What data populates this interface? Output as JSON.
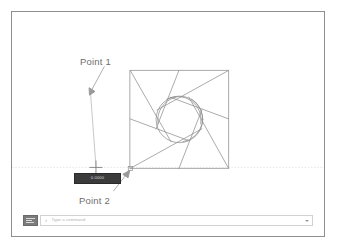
{
  "app": {
    "type": "cad-drawing-canvas",
    "background_color": "#ffffff",
    "frame_border_color": "#8e8e8e"
  },
  "canvas": {
    "tracking_line": {
      "label": "horizontal-tracking-line",
      "color": "#dcdcdc",
      "y": 157,
      "x_start": 0,
      "x_end": 314
    },
    "crosshair": {
      "label": "crosshair-cursor",
      "x": 84,
      "y": 157,
      "color": "#6f6f6f",
      "size": 9
    },
    "snap_marker": {
      "label": "endpoint-snap-marker",
      "x": 119,
      "y": 158,
      "color": "#8a8a8a",
      "size": 4
    }
  },
  "geometry": {
    "name": "pinwheel-square",
    "stroke_color": "#8d8d8d",
    "square": {
      "x": 119,
      "y": 59,
      "size": 99
    },
    "circle": {
      "cx": 168.5,
      "cy": 108.5,
      "r": 23.5
    },
    "blade_count": 7
  },
  "annotations": [
    {
      "id": "point-1",
      "label": "Point 1",
      "label_x": 68,
      "label_y": 44,
      "arrow_from": [
        92,
        56
      ],
      "arrow_to": [
        78,
        82
      ],
      "leader_to": [
        85,
        155
      ],
      "color": "#6e6e6e"
    },
    {
      "id": "point-2",
      "label": "Point 2",
      "label_x": 67,
      "label_y": 183,
      "arrow_from": [
        101,
        182
      ],
      "arrow_to": [
        117,
        162
      ],
      "color": "#6e6e6e"
    }
  ],
  "dynamic_input": {
    "name": "dynamic-input-tooltip",
    "text": "0.0000",
    "background": "#3b3b3b",
    "text_color": "#d8d8d8",
    "x": 62,
    "y": 161,
    "width": 45,
    "height": 8.5
  },
  "command_bar": {
    "history_button_label": "command-history",
    "prompt_icon": "›",
    "input_value": "",
    "input_placeholder": "Type a command",
    "dropdown_label": "command-options"
  }
}
